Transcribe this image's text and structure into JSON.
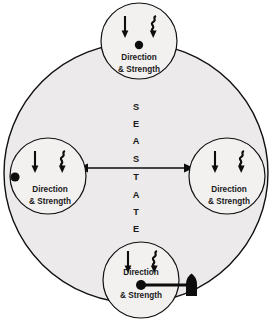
{
  "diagram": {
    "type": "conceptual-radial-diagram",
    "center_axis": {
      "vertical_text": "SEA STATE",
      "vertical_letters": [
        "S",
        "E",
        "A",
        "S",
        "T",
        "A",
        "T",
        "E"
      ],
      "horizontal_arrow": "double-headed-arrow",
      "vertical_arrow": "implied-vertical-axis"
    },
    "outer_circle": {
      "name": "sea-state-boundary",
      "fill_color": "#eceaea",
      "stroke_color": "#101010"
    },
    "nodes": [
      {
        "id": "top",
        "position": "top",
        "line1": "Direction",
        "line2": "& Strength",
        "glyphs": [
          "straight-down-arrow",
          "zigzag-down-arrow"
        ],
        "has_dot": true,
        "has_flag": false
      },
      {
        "id": "left",
        "position": "left",
        "line1": "Direction",
        "line2": "& Strength",
        "glyphs": [
          "straight-down-arrow",
          "zigzag-down-arrow"
        ],
        "has_dot": true,
        "has_flag": false
      },
      {
        "id": "right",
        "position": "right",
        "line1": "Direction",
        "line2": "& Strength",
        "glyphs": [
          "straight-down-arrow",
          "zigzag-down-arrow"
        ],
        "has_dot": false,
        "has_flag": false
      },
      {
        "id": "bottom",
        "position": "bottom",
        "line1": "Direction",
        "line2": "& Strength",
        "glyphs": [
          "straight-down-arrow",
          "zigzag-down-arrow"
        ],
        "has_dot": true,
        "has_flag": true
      }
    ],
    "colors": {
      "ink": "#0d0d0d",
      "outer_fill": "#eceaea",
      "node_fill": "#f2f1f0",
      "page_background": "#ffffff"
    }
  }
}
